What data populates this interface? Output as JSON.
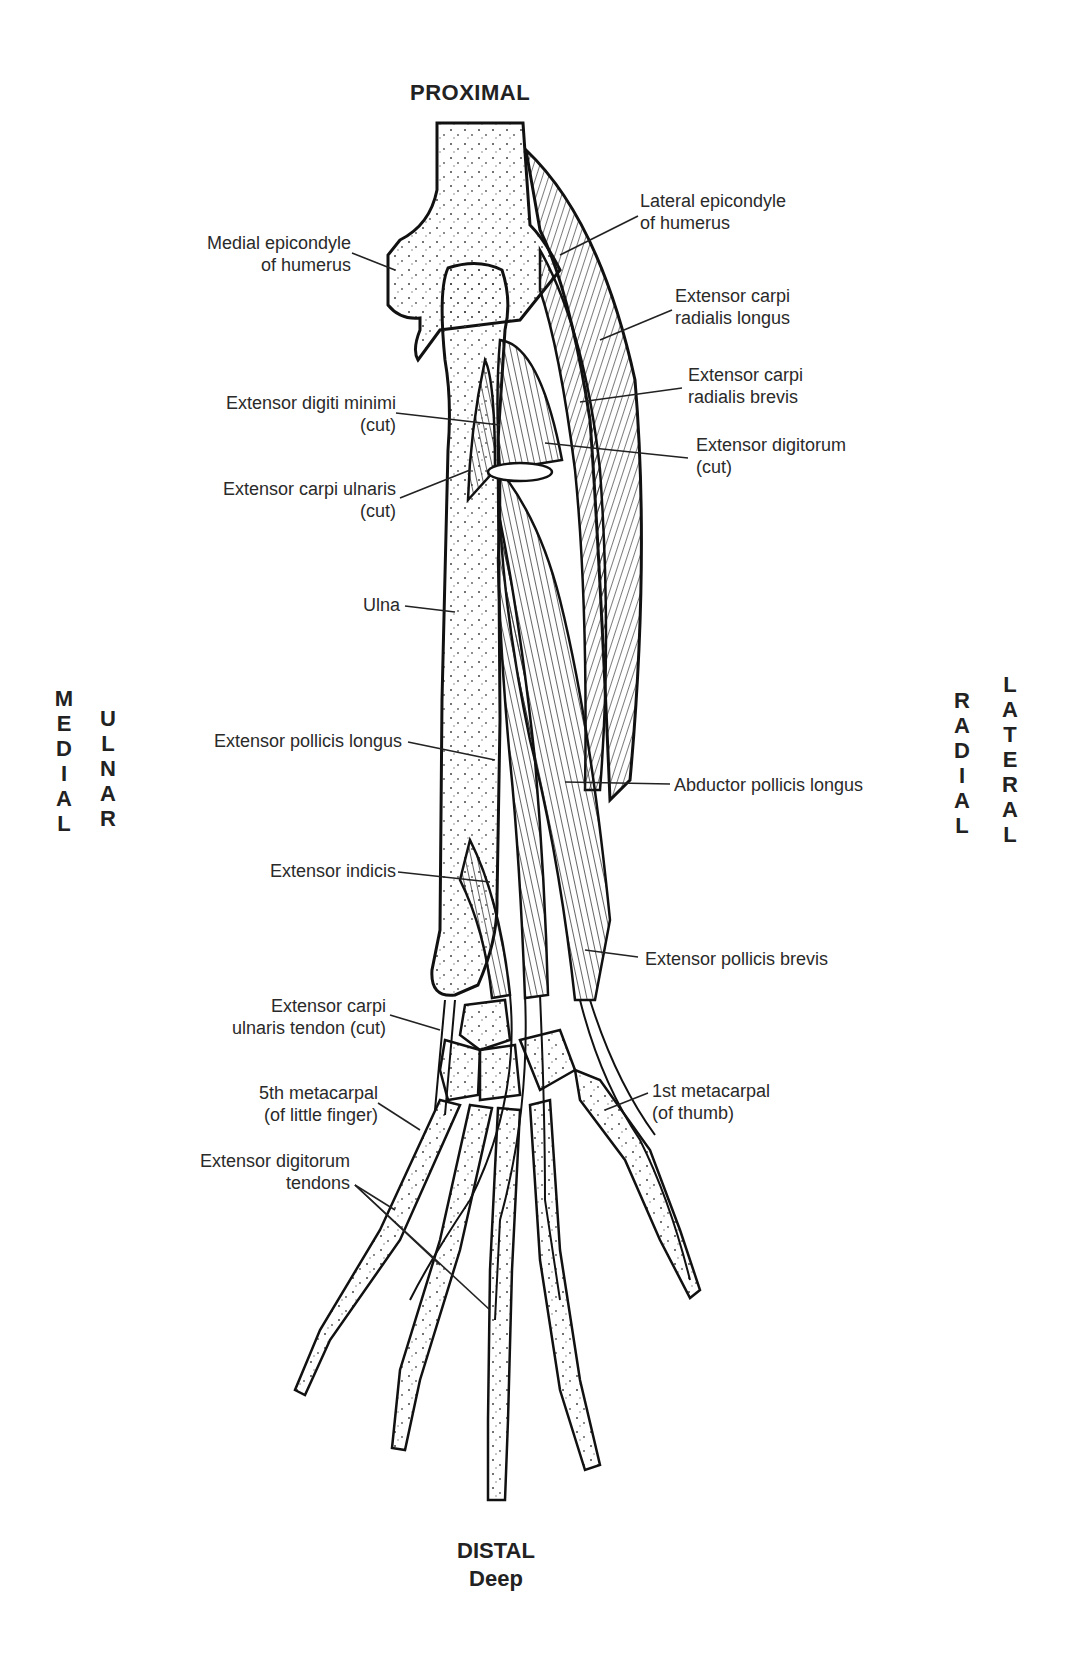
{
  "diagram": {
    "title_top": "PROXIMAL",
    "title_bottom": "DISTAL",
    "subtitle_bottom": "Deep",
    "left_orientation": {
      "outer": "MEDIAL",
      "inner": "ULNAR"
    },
    "right_orientation": {
      "inner": "RADIAL",
      "outer": "LATERAL"
    },
    "labels_left": [
      {
        "line1": "Medial epicondyle",
        "line2": "of humerus"
      },
      {
        "line1": "Extensor digiti minimi",
        "line2": "(cut)"
      },
      {
        "line1": "Extensor carpi ulnaris",
        "line2": "(cut)"
      },
      {
        "line1": "Ulna",
        "line2": ""
      },
      {
        "line1": "Extensor pollicis longus",
        "line2": ""
      },
      {
        "line1": "Extensor indicis",
        "line2": ""
      },
      {
        "line1": "Extensor carpi",
        "line2": "ulnaris tendon (cut)"
      },
      {
        "line1": "5th metacarpal",
        "line2": "(of little finger)"
      },
      {
        "line1": "Extensor digitorum",
        "line2": "tendons"
      }
    ],
    "labels_right": [
      {
        "line1": "Lateral epicondyle",
        "line2": "of humerus"
      },
      {
        "line1": "Extensor carpi",
        "line2": "radialis longus"
      },
      {
        "line1": "Extensor carpi",
        "line2": "radialis brevis"
      },
      {
        "line1": "Extensor digitorum",
        "line2": "(cut)"
      },
      {
        "line1": "Abductor pollicis longus",
        "line2": ""
      },
      {
        "line1": "Extensor pollicis brevis",
        "line2": ""
      },
      {
        "line1": "1st metacarpal",
        "line2": "(of thumb)"
      }
    ]
  }
}
